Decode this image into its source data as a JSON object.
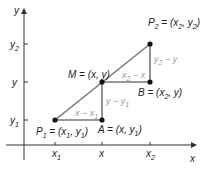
{
  "diagram": {
    "axes": {
      "x_label": "x",
      "y_label": "y",
      "x_ticks": [
        {
          "label": "x",
          "sub": "1"
        },
        {
          "label": "x",
          "sub": ""
        },
        {
          "label": "x",
          "sub": "2"
        }
      ],
      "y_ticks": [
        {
          "label": "y",
          "sub": "2"
        },
        {
          "label": "y",
          "sub": ""
        },
        {
          "label": "y",
          "sub": "1"
        }
      ]
    },
    "points": {
      "P1": {
        "name": "P",
        "sub": "1",
        "text": " = (x",
        "sub2": "1",
        "text2": ", y",
        "sub3": "1",
        "text3": ")"
      },
      "P2": {
        "name": "P",
        "sub": "2",
        "text": " = (x",
        "sub2": "2",
        "text2": ", y",
        "sub3": "2",
        "text3": ")"
      },
      "M": {
        "text": "M = (x, y)"
      },
      "A": {
        "text": "A = (x, y",
        "sub": "1",
        "end": ")"
      },
      "B": {
        "text": "B = (x",
        "sub": "2",
        "end": ", y)"
      }
    },
    "segment_labels": {
      "lower_horizontal": {
        "text": "x − x",
        "sub": "1"
      },
      "lower_vertical": {
        "text": "y − y",
        "sub": "1"
      },
      "upper_horizontal": {
        "text": "x",
        "sub": "2",
        "rest": " − x"
      },
      "upper_vertical": {
        "text": "y",
        "sub": "2",
        "rest": " − y"
      }
    },
    "colors": {
      "line": "#777777",
      "point": "#111111",
      "axis": "#333333",
      "segment_label": "#999999"
    }
  }
}
